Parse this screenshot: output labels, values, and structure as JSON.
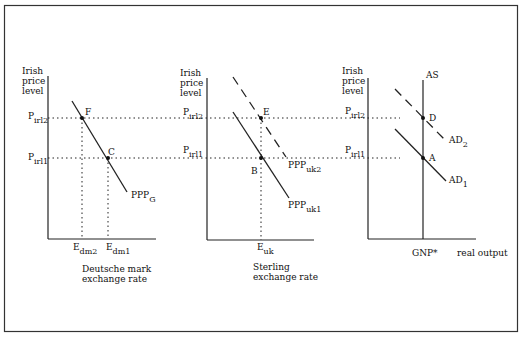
{
  "frame": {
    "border_color": "#333333",
    "background": "#ffffff"
  },
  "y_axis_label": [
    "Irish",
    "price",
    "level"
  ],
  "price_levels": {
    "p2": {
      "main": "P",
      "sub": "irl2"
    },
    "p1": {
      "main": "P",
      "sub": "irl1"
    }
  },
  "panel_left": {
    "x_axis_label": [
      "Deutsche mark",
      "exchange rate"
    ],
    "curve": {
      "main": "PPP",
      "sub": "G"
    },
    "points": {
      "upper": "F",
      "lower": "C"
    },
    "x_ticks": [
      {
        "main": "E",
        "sub": "dm2"
      },
      {
        "main": "E",
        "sub": "dm1"
      }
    ]
  },
  "panel_middle": {
    "x_axis_label": [
      "Sterling",
      "exchange rate"
    ],
    "curve_solid": {
      "main": "PPP",
      "sub": "uk1"
    },
    "curve_dashed": {
      "main": "PPP",
      "sub": "uk2"
    },
    "points": {
      "upper": "E",
      "lower": "B"
    },
    "x_ticks": [
      {
        "main": "E",
        "sub": "uk"
      }
    ]
  },
  "panel_right": {
    "x_axis_label": "real output",
    "vertical_curve": "AS",
    "curve_solid": {
      "main": "AD",
      "sub": "1"
    },
    "curve_dashed": {
      "main": "AD",
      "sub": "2"
    },
    "points": {
      "upper": "D",
      "lower": "A"
    },
    "x_ticks": [
      {
        "label": "GNP*"
      }
    ]
  }
}
